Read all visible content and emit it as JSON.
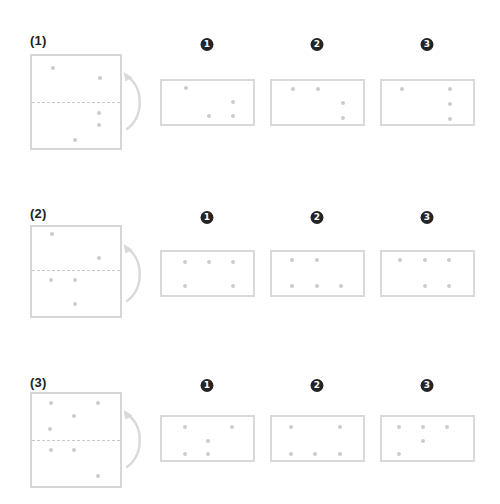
{
  "page": {
    "width": 500,
    "height": 504,
    "background": "#ffffff",
    "dot_color": "#cccccc",
    "outline_color": "#d6d6d6",
    "fold_line_color": "#c9c9c9",
    "badge_color": "#242424",
    "label_color": "#222222"
  },
  "puzzle": {
    "type": "paper-folding-punched-holes",
    "rows": [
      {
        "label": "(1)",
        "label_pos": {
          "x": 30,
          "y": 34
        },
        "source": {
          "name": "folded-paper-1",
          "box": {
            "x": 30,
            "y": 54,
            "w": 92,
            "h": 96
          },
          "fold_line_y": 102,
          "dots": [
            {
              "x": 53,
              "y": 68
            },
            {
              "x": 100,
              "y": 78
            },
            {
              "x": 99,
              "y": 113
            },
            {
              "x": 99,
              "y": 125
            },
            {
              "x": 75,
              "y": 140
            }
          ]
        },
        "arrow": {
          "x": 120,
          "y": 66
        },
        "options": [
          {
            "number": "1",
            "badge_pos": {
              "x": 207,
              "y": 38
            },
            "box": {
              "x": 160,
              "y": 79,
              "w": 95,
              "h": 47
            },
            "dots": [
              {
                "x": 186,
                "y": 88
              },
              {
                "x": 233,
                "y": 102
              },
              {
                "x": 209,
                "y": 116
              },
              {
                "x": 233,
                "y": 116
              }
            ]
          },
          {
            "number": "2",
            "badge_pos": {
              "x": 317,
              "y": 38
            },
            "box": {
              "x": 270,
              "y": 79,
              "w": 95,
              "h": 47
            },
            "dots": [
              {
                "x": 293,
                "y": 89
              },
              {
                "x": 318,
                "y": 89
              },
              {
                "x": 343,
                "y": 103
              },
              {
                "x": 343,
                "y": 118
              }
            ]
          },
          {
            "number": "3",
            "badge_pos": {
              "x": 427,
              "y": 38
            },
            "box": {
              "x": 380,
              "y": 79,
              "w": 95,
              "h": 47
            },
            "dots": [
              {
                "x": 402,
                "y": 89
              },
              {
                "x": 450,
                "y": 89
              },
              {
                "x": 450,
                "y": 104
              },
              {
                "x": 450,
                "y": 119
              }
            ]
          }
        ]
      },
      {
        "label": "(2)",
        "label_pos": {
          "x": 30,
          "y": 207
        },
        "source": {
          "name": "folded-paper-2",
          "box": {
            "x": 30,
            "y": 225,
            "w": 92,
            "h": 93
          },
          "fold_line_y": 270,
          "dots": [
            {
              "x": 52,
              "y": 234
            },
            {
              "x": 99,
              "y": 258
            },
            {
              "x": 51,
              "y": 280
            },
            {
              "x": 75,
              "y": 280
            },
            {
              "x": 75,
              "y": 304
            }
          ]
        },
        "arrow": {
          "x": 120,
          "y": 238
        },
        "options": [
          {
            "number": "1",
            "badge_pos": {
              "x": 207,
              "y": 211
            },
            "box": {
              "x": 160,
              "y": 250,
              "w": 95,
              "h": 47
            },
            "dots": [
              {
                "x": 185,
                "y": 262
              },
              {
                "x": 209,
                "y": 262
              },
              {
                "x": 233,
                "y": 262
              },
              {
                "x": 185,
                "y": 286
              },
              {
                "x": 233,
                "y": 286
              }
            ]
          },
          {
            "number": "2",
            "badge_pos": {
              "x": 317,
              "y": 211
            },
            "box": {
              "x": 270,
              "y": 250,
              "w": 95,
              "h": 47
            },
            "dots": [
              {
                "x": 292,
                "y": 260
              },
              {
                "x": 317,
                "y": 260
              },
              {
                "x": 292,
                "y": 286
              },
              {
                "x": 317,
                "y": 286
              },
              {
                "x": 341,
                "y": 286
              }
            ]
          },
          {
            "number": "3",
            "badge_pos": {
              "x": 427,
              "y": 211
            },
            "box": {
              "x": 380,
              "y": 250,
              "w": 95,
              "h": 47
            },
            "dots": [
              {
                "x": 400,
                "y": 260
              },
              {
                "x": 425,
                "y": 260
              },
              {
                "x": 449,
                "y": 260
              },
              {
                "x": 425,
                "y": 286
              },
              {
                "x": 449,
                "y": 286
              }
            ]
          }
        ]
      },
      {
        "label": "(3)",
        "label_pos": {
          "x": 30,
          "y": 376
        },
        "source": {
          "name": "folded-paper-3",
          "box": {
            "x": 30,
            "y": 392,
            "w": 92,
            "h": 96
          },
          "fold_line_y": 440,
          "dots": [
            {
              "x": 51,
              "y": 403
            },
            {
              "x": 98,
              "y": 403
            },
            {
              "x": 74,
              "y": 416
            },
            {
              "x": 50,
              "y": 429
            },
            {
              "x": 51,
              "y": 450
            },
            {
              "x": 74,
              "y": 450
            },
            {
              "x": 98,
              "y": 476
            }
          ]
        },
        "arrow": {
          "x": 120,
          "y": 404
        },
        "options": [
          {
            "number": "1",
            "badge_pos": {
              "x": 207,
              "y": 379
            },
            "box": {
              "x": 160,
              "y": 415,
              "w": 95,
              "h": 47
            },
            "dots": [
              {
                "x": 185,
                "y": 427
              },
              {
                "x": 232,
                "y": 427
              },
              {
                "x": 208,
                "y": 441
              },
              {
                "x": 185,
                "y": 454
              },
              {
                "x": 208,
                "y": 454
              }
            ]
          },
          {
            "number": "2",
            "badge_pos": {
              "x": 317,
              "y": 379
            },
            "box": {
              "x": 270,
              "y": 415,
              "w": 95,
              "h": 47
            },
            "dots": [
              {
                "x": 291,
                "y": 427
              },
              {
                "x": 340,
                "y": 427
              },
              {
                "x": 291,
                "y": 454
              },
              {
                "x": 315,
                "y": 454
              },
              {
                "x": 340,
                "y": 454
              }
            ]
          },
          {
            "number": "3",
            "badge_pos": {
              "x": 427,
              "y": 379
            },
            "box": {
              "x": 380,
              "y": 415,
              "w": 95,
              "h": 47
            },
            "dots": [
              {
                "x": 399,
                "y": 427
              },
              {
                "x": 423,
                "y": 427
              },
              {
                "x": 447,
                "y": 427
              },
              {
                "x": 423,
                "y": 441
              },
              {
                "x": 399,
                "y": 454
              }
            ]
          }
        ]
      }
    ]
  }
}
